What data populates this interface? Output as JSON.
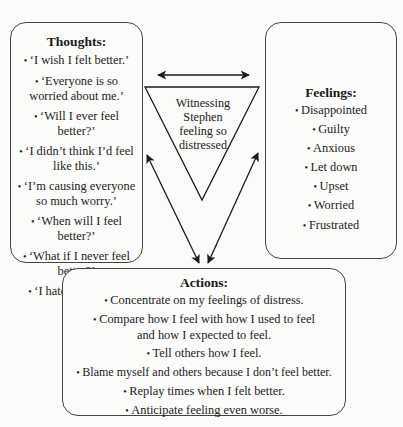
{
  "diagram": {
    "center": {
      "label": "Witnessing Stephen feeling so distressed"
    },
    "thoughts": {
      "title": "Thoughts:",
      "items": [
        "‘I wish I felt better.’",
        "‘Everyone is so worried about me.’",
        "‘Will I ever feel better?’",
        "‘I didn’t think I’d feel like this.’",
        "‘I’m causing everyone so much worry.’",
        "‘When will I feel better?’",
        "‘What if I never feel better?’",
        "‘I hate feeling this bad.’"
      ]
    },
    "feelings": {
      "title": "Feelings:",
      "items": [
        "Disappointed",
        "Guilty",
        "Anxious",
        "Let down",
        "Upset",
        "Worried",
        "Frustrated"
      ]
    },
    "actions": {
      "title": "Actions:",
      "items": [
        "Concentrate on my feelings of distress.",
        "Compare how I feel with how I used to feel and how I expected to feel.",
        "Tell others how I feel.",
        "Blame myself and others because I don’t feel better.",
        "Replay times when I felt better.",
        "Anticipate feeling even worse."
      ]
    },
    "connections": [
      {
        "from": "thoughts",
        "to": "feelings",
        "type": "double-arrow"
      },
      {
        "from": "thoughts",
        "to": "actions",
        "type": "double-arrow"
      },
      {
        "from": "feelings",
        "to": "actions",
        "type": "double-arrow"
      }
    ],
    "colors": {
      "line": "#1a1a1a",
      "box_border": "#444444",
      "background": "#fbfbfa"
    }
  }
}
